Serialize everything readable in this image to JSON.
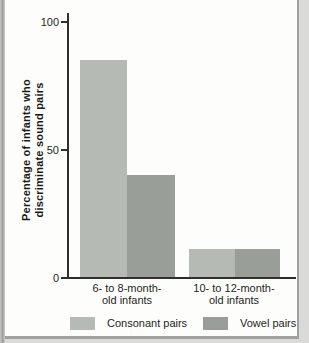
{
  "chart_data": {
    "type": "bar",
    "title": "",
    "xlabel": "",
    "ylabel": "Percentage of infants who discriminate sound pairs",
    "ylabel_lines": [
      "Percentage of infants who",
      "discriminate sound pairs"
    ],
    "ylim": [
      0,
      100
    ],
    "yticks": [
      0,
      50,
      100
    ],
    "grid": false,
    "legend_position": "bottom",
    "categories": [
      {
        "label": "6- to 8-month-old infants",
        "lines": [
          "6- to 8-month-",
          "old infants"
        ]
      },
      {
        "label": "10- to 12-month-old infants",
        "lines": [
          "10- to 12-month-",
          "old infants"
        ]
      }
    ],
    "series": [
      {
        "name": "Consonant pairs",
        "color": "#b6bab4",
        "values": [
          85,
          11
        ]
      },
      {
        "name": "Vowel pairs",
        "color": "#9a9e98",
        "values": [
          40,
          11
        ]
      }
    ]
  },
  "colors": {
    "axis": "#2f2f2d",
    "text": "#1e1e1c",
    "panel_background": "#fdfdfc",
    "frame_border": "#a1a19f",
    "outer_background": "#dadad8"
  }
}
